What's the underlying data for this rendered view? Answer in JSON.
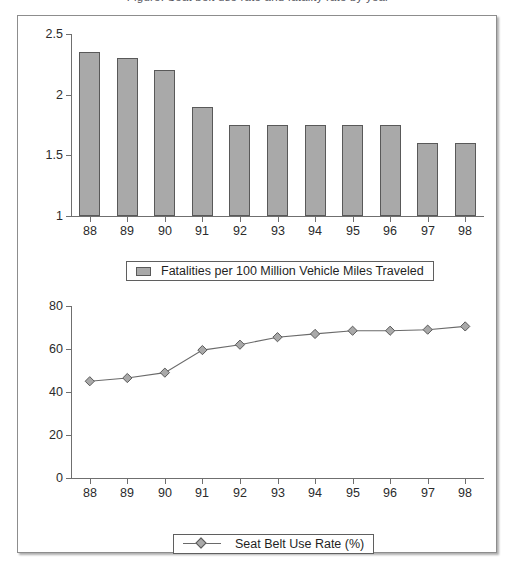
{
  "caption": {
    "text": "Figure. Seat belt use rate and fatality rate by year"
  },
  "colors": {
    "bar_fill": "#a9a9a9",
    "bar_stroke": "#595959",
    "axis": "#6f6f6f",
    "line": "#6a6a6a",
    "frame": "#8d8d8d",
    "text": "#2b2b2b"
  },
  "chart_data": [
    {
      "type": "bar",
      "id": "fatalities-bar-chart",
      "title": "",
      "xlabel": "",
      "ylabel": "",
      "categories": [
        "88",
        "89",
        "90",
        "91",
        "92",
        "93",
        "94",
        "95",
        "96",
        "97",
        "98"
      ],
      "values": [
        2.35,
        2.3,
        2.2,
        1.9,
        1.75,
        1.75,
        1.75,
        1.75,
        1.75,
        1.6,
        1.6
      ],
      "ylim": [
        1,
        2.5
      ],
      "yticks": [
        1,
        1.5,
        2,
        2.5
      ],
      "ytick_labels": [
        "1",
        "1.5",
        "2",
        "2.5"
      ],
      "grid": false,
      "legend_position": "bottom",
      "legend": [
        "Fatalities per 100 Million Vehicle Miles Traveled"
      ]
    },
    {
      "type": "line",
      "id": "seatbelt-line-chart",
      "title": "",
      "xlabel": "",
      "ylabel": "",
      "categories": [
        "88",
        "89",
        "90",
        "91",
        "92",
        "93",
        "94",
        "95",
        "96",
        "97",
        "98"
      ],
      "values": [
        45,
        46.5,
        49,
        59.5,
        62,
        65.5,
        67,
        68.5,
        68.5,
        69,
        70.5
      ],
      "ylim": [
        0,
        80
      ],
      "yticks": [
        0,
        20,
        40,
        60,
        80
      ],
      "ytick_labels": [
        "0",
        "20",
        "40",
        "60",
        "80"
      ],
      "grid": false,
      "marker": "diamond",
      "legend_position": "bottom",
      "legend": [
        "Seat Belt Use Rate (%)"
      ]
    }
  ],
  "bar_chart": {
    "ytick_labels": [
      "2.5",
      "2",
      "1.5",
      "1"
    ],
    "xtick_labels": [
      "88",
      "89",
      "90",
      "91",
      "92",
      "93",
      "94",
      "95",
      "96",
      "97",
      "98"
    ],
    "legend_label": "Fatalities per 100 Million Vehicle Miles Traveled"
  },
  "line_chart": {
    "ytick_labels": [
      "80",
      "60",
      "40",
      "20",
      "0"
    ],
    "xtick_labels": [
      "88",
      "89",
      "90",
      "91",
      "92",
      "93",
      "94",
      "95",
      "96",
      "97",
      "98"
    ],
    "legend_label": "Seat Belt Use Rate (%)"
  }
}
